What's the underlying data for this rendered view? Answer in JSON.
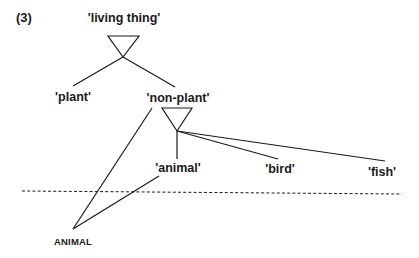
{
  "figure": {
    "number": "(3)",
    "nodes": {
      "living_thing": "'living thing'",
      "plant": "'plant'",
      "non_plant": "'non-plant'",
      "animal_concept": "'animal'",
      "bird": "'bird'",
      "fish": "'fish'",
      "animal_word": "ANIMAL"
    },
    "edges": [
      {
        "from": "living thing",
        "to": "plant"
      },
      {
        "from": "living thing",
        "to": "non-plant"
      },
      {
        "from": "non-plant",
        "to": "animal"
      },
      {
        "from": "non-plant",
        "to": "bird"
      },
      {
        "from": "non-plant",
        "to": "fish"
      },
      {
        "from": "ANIMAL",
        "to": "non-plant"
      },
      {
        "from": "ANIMAL",
        "to": "animal"
      }
    ],
    "divider": "dashed horizontal line separating conceptual level from lexical level",
    "colors": {
      "ink": "#1a1a1a",
      "background": "#ffffff"
    }
  }
}
